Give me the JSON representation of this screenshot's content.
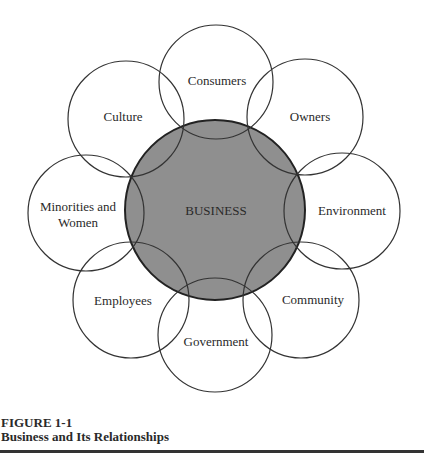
{
  "diagram": {
    "center": {
      "label": "BUSINESS",
      "cx": 215,
      "cy": 210,
      "r": 90,
      "fill": "#8f8f8f",
      "stroke": "#222222"
    },
    "satellites": [
      {
        "id": "consumers",
        "label": "Consumers",
        "cx": 216,
        "cy": 82,
        "r": 57
      },
      {
        "id": "owners",
        "label": "Owners",
        "cx": 305,
        "cy": 117,
        "r": 58
      },
      {
        "id": "environment",
        "label": "Environment",
        "cx": 342,
        "cy": 211,
        "r": 58
      },
      {
        "id": "community",
        "label": "Community",
        "cx": 301,
        "cy": 300,
        "r": 58
      },
      {
        "id": "government",
        "label": "Government",
        "cx": 215,
        "cy": 335,
        "r": 57
      },
      {
        "id": "employees",
        "label": "Employees",
        "cx": 131,
        "cy": 300,
        "r": 58
      },
      {
        "id": "minorities",
        "label_line1": "Minorities and",
        "label_line2": "Women",
        "cx": 86,
        "cy": 213,
        "r": 58
      },
      {
        "id": "culture",
        "label": "Culture",
        "cx": 126,
        "cy": 119,
        "r": 58
      }
    ],
    "stroke_color": "#333333"
  },
  "caption": {
    "figure_number": "FIGURE 1-1",
    "title": "Business and Its Relationships"
  }
}
